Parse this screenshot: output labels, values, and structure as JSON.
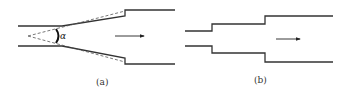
{
  "figure": {
    "panels": [
      {
        "label": "(a)",
        "description": "Gradual (conical) expansion pipe with divergence angle",
        "angle_symbol": "α",
        "flow_direction": "right"
      },
      {
        "label": "(b)",
        "description": "Stepped (sudden) expansion pipe with two steps",
        "flow_direction": "right"
      }
    ]
  }
}
